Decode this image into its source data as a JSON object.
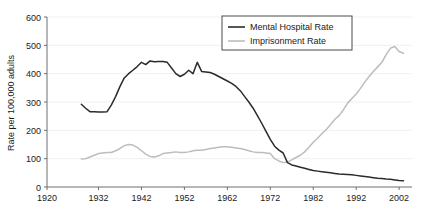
{
  "chart_data": {
    "type": "line",
    "title": "",
    "xlabel": "",
    "ylabel": "Rate per 100,000 adults",
    "xlim": [
      1920,
      2005
    ],
    "ylim": [
      0,
      600
    ],
    "xticks": [
      1920,
      1932,
      1942,
      1952,
      1962,
      1972,
      1982,
      1992,
      2002
    ],
    "yticks": [
      0,
      100,
      200,
      300,
      400,
      500,
      600
    ],
    "grid": "horizontal",
    "legend_position": "top-right",
    "series": [
      {
        "name": "Mental Hospital Rate",
        "color": "#2b2b2b",
        "x": [
          1928,
          1929,
          1930,
          1931,
          1932,
          1933,
          1934,
          1935,
          1936,
          1937,
          1938,
          1939,
          1940,
          1941,
          1942,
          1943,
          1944,
          1945,
          1946,
          1947,
          1948,
          1949,
          1950,
          1951,
          1952,
          1953,
          1954,
          1955,
          1956,
          1957,
          1958,
          1959,
          1960,
          1961,
          1962,
          1963,
          1964,
          1965,
          1966,
          1967,
          1968,
          1969,
          1970,
          1971,
          1972,
          1973,
          1974,
          1975,
          1976,
          1977,
          1978,
          1979,
          1980,
          1981,
          1982,
          1983,
          1984,
          1985,
          1986,
          1987,
          1988,
          1989,
          1990,
          1991,
          1992,
          1993,
          1994,
          1995,
          1996,
          1997,
          1998,
          1999,
          2000,
          2001,
          2002,
          2003
        ],
        "values": [
          292,
          278,
          266,
          266,
          265,
          265,
          266,
          290,
          320,
          355,
          385,
          400,
          412,
          425,
          440,
          432,
          445,
          442,
          443,
          443,
          440,
          420,
          400,
          390,
          398,
          412,
          400,
          440,
          408,
          406,
          404,
          398,
          390,
          382,
          374,
          366,
          355,
          340,
          320,
          300,
          278,
          252,
          225,
          196,
          168,
          144,
          130,
          120,
          86,
          78,
          74,
          70,
          66,
          62,
          58,
          56,
          54,
          52,
          50,
          48,
          46,
          45,
          44,
          43,
          41,
          39,
          37,
          35,
          33,
          31,
          30,
          28,
          27,
          25,
          23,
          22
        ]
      },
      {
        "name": "Imprisonment Rate",
        "color": "#bdbdbd",
        "x": [
          1928,
          1929,
          1930,
          1931,
          1932,
          1933,
          1934,
          1935,
          1936,
          1937,
          1938,
          1939,
          1940,
          1941,
          1942,
          1943,
          1944,
          1945,
          1946,
          1947,
          1948,
          1949,
          1950,
          1951,
          1952,
          1953,
          1954,
          1955,
          1956,
          1957,
          1958,
          1959,
          1960,
          1961,
          1962,
          1963,
          1964,
          1965,
          1966,
          1967,
          1968,
          1969,
          1970,
          1971,
          1972,
          1973,
          1974,
          1975,
          1976,
          1977,
          1978,
          1979,
          1980,
          1981,
          1982,
          1983,
          1984,
          1985,
          1986,
          1987,
          1988,
          1989,
          1990,
          1991,
          1992,
          1993,
          1994,
          1995,
          1996,
          1997,
          1998,
          1999,
          2000,
          2001,
          2002,
          2003
        ],
        "values": [
          99,
          100,
          106,
          112,
          118,
          120,
          122,
          122,
          128,
          136,
          146,
          150,
          148,
          140,
          128,
          116,
          108,
          106,
          110,
          118,
          120,
          122,
          124,
          122,
          122,
          124,
          128,
          130,
          130,
          132,
          136,
          138,
          140,
          142,
          142,
          140,
          138,
          136,
          132,
          128,
          124,
          122,
          122,
          120,
          118,
          100,
          92,
          86,
          88,
          96,
          104,
          112,
          124,
          140,
          158,
          172,
          188,
          202,
          220,
          238,
          252,
          272,
          296,
          312,
          328,
          348,
          370,
          390,
          408,
          424,
          440,
          468,
          490,
          496,
          478,
          472
        ]
      }
    ]
  },
  "legend": {
    "entries": [
      {
        "label": "Mental Hospital Rate"
      },
      {
        "label": "Imprisonment Rate"
      }
    ]
  },
  "axes": {
    "y_title": "Rate per 100,000 adults",
    "x_tick_labels": [
      "1920",
      "1932",
      "1942",
      "1952",
      "1962",
      "1972",
      "1982",
      "1992",
      "2002"
    ],
    "y_tick_labels": [
      "0",
      "100",
      "200",
      "300",
      "400",
      "500",
      "600"
    ]
  }
}
